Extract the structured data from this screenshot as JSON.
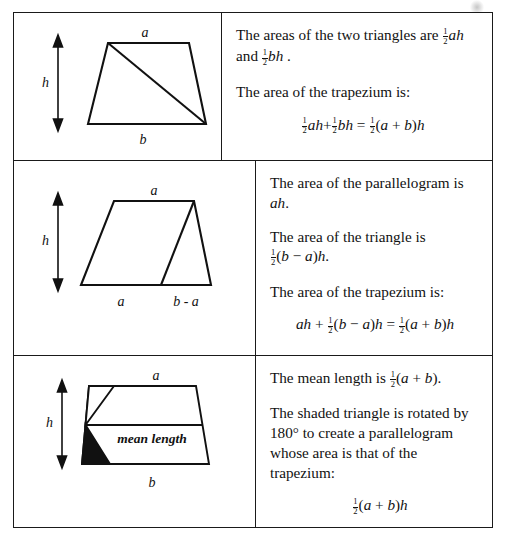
{
  "document": {
    "title": "Area of a Trapezium — three derivations",
    "ink_color": "#111111"
  },
  "rows": [
    {
      "id": "row-two-triangles",
      "figure": {
        "name": "trapezium-split-into-two-triangles",
        "labels": {
          "top": "a",
          "bottom": "b",
          "height": "h"
        }
      },
      "text": {
        "p1_prefix": "The areas of the two triangles are",
        "p1_expr_1_num": "1",
        "p1_expr_1_den": "2",
        "p1_expr_1_vars": "ah",
        "p1_conj": "and",
        "p1_expr_2_num": "1",
        "p1_expr_2_den": "2",
        "p1_expr_2_vars": "bh",
        "p1_period": ".",
        "p2": "The area of the trapezium is:",
        "eq": {
          "t1_num": "1",
          "t1_den": "2",
          "t1_vars": "ah",
          "op1": "+",
          "t2_num": "1",
          "t2_den": "2",
          "t2_vars": "bh",
          "eq_sign": "=",
          "t3_num": "1",
          "t3_den": "2",
          "t3_open": "(",
          "t3_a": "a",
          "t3_plus": "+",
          "t3_b": "b",
          "t3_close": ")",
          "t3_h": "h"
        }
      }
    },
    {
      "id": "row-parallelogram-plus-triangle",
      "figure": {
        "name": "trapezium-split-into-parallelogram-and-triangle",
        "labels": {
          "top": "a",
          "bottom_left": "a",
          "bottom_right": "b - a",
          "height": "h"
        }
      },
      "text": {
        "p1_line1": "The area of the parallelogram is",
        "p1_line2_vars": "ah",
        "p1_line2_period": ".",
        "p2_line1": "The area of the triangle is",
        "p2_num": "1",
        "p2_den": "2",
        "p2_open": "(",
        "p2_b": "b",
        "p2_minus": "−",
        "p2_a": "a",
        "p2_close": ")",
        "p2_h": "h",
        "p2_period": ".",
        "p3": "The area of the trapezium is:",
        "eq": {
          "t1_vars": "ah",
          "op1": "+",
          "t2_num": "1",
          "t2_den": "2",
          "t2_open": "(",
          "t2_b": "b",
          "t2_minus": "−",
          "t2_a": "a",
          "t2_close": ")",
          "t2_h": "h",
          "eq_sign": "=",
          "t3_num": "1",
          "t3_den": "2",
          "t3_open": "(",
          "t3_a": "a",
          "t3_plus": "+",
          "t3_b": "b",
          "t3_close": ")",
          "t3_h": "h"
        }
      }
    },
    {
      "id": "row-mean-length",
      "figure": {
        "name": "trapezium-with-mean-length-and-rotated-shaded-triangle",
        "labels": {
          "top": "a",
          "bottom": "b",
          "height": "h",
          "mid": "mean length"
        },
        "shaded_triangle_fill": "#111111"
      },
      "text": {
        "p1_prefix": "The mean length is",
        "p1_num": "1",
        "p1_den": "2",
        "p1_open": "(",
        "p1_a": "a",
        "p1_plus": "+",
        "p1_b": "b",
        "p1_close": ")",
        "p1_period": ".",
        "p2_line1": "The shaded triangle is rotated by",
        "p2_line2": "180° to create a parallelogram",
        "p2_line3": "whose area is that of the",
        "p2_line4": "trapezium:",
        "eq": {
          "num": "1",
          "den": "2",
          "open": "(",
          "a": "a",
          "plus": "+",
          "b": "b",
          "close": ")",
          "h": "h"
        }
      }
    }
  ]
}
